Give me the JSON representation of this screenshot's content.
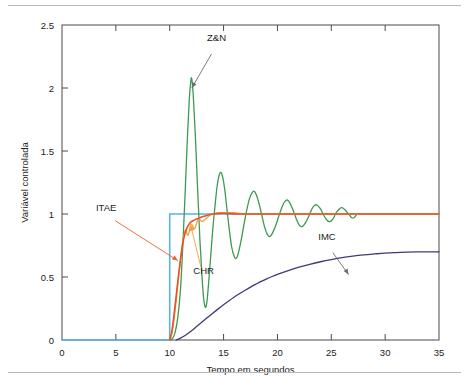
{
  "figure": {
    "background_color": "#ffffff",
    "rules": {
      "top_color": "#b9b9bd",
      "bottom_color": "#b9b9bd"
    }
  },
  "chart_data": {
    "type": "line",
    "title": "",
    "subtitle": "",
    "xlabel": "Tempo em segundos",
    "ylabel": "Variável controlada",
    "xlim": [
      0,
      35
    ],
    "ylim": [
      0,
      2.5
    ],
    "xticks": [
      0,
      5,
      10,
      15,
      20,
      25,
      30,
      35
    ],
    "xticklabels": [
      "0",
      "5",
      "10",
      "15",
      "20",
      "25",
      "30",
      "35"
    ],
    "yticks": [
      0,
      0.5,
      1,
      1.5,
      2,
      2.5
    ],
    "yticklabels": [
      "0",
      "0.5",
      "1",
      "1.5",
      "2",
      "2.5"
    ],
    "grid": false,
    "legend_position": "inline-annotations",
    "frame_color": "#4a4a4a",
    "annotations": [
      {
        "text": "Z&N",
        "label_x": 14.35,
        "label_y": 2.37,
        "point_x": 12.05,
        "point_y": 2.0,
        "color": "#6d6d6d"
      },
      {
        "text": "ITAE",
        "label_x": 4.1,
        "label_y": 1.02,
        "point_x": 10.75,
        "point_y": 0.63,
        "color": "#e8632a"
      },
      {
        "text": "CHR",
        "label_x": 13.15,
        "label_y": 0.52,
        "point_x": 11.95,
        "point_y": 0.91,
        "color": "#f2a03c"
      },
      {
        "text": "IMC",
        "label_x": 24.6,
        "label_y": 0.79,
        "point_x": 26.6,
        "point_y": 0.52,
        "color": "#6d6d6d"
      }
    ],
    "series": [
      {
        "name": "Setpoint (degrau)",
        "color": "#58b4e2",
        "width": 1.6,
        "points": [
          [
            0,
            0
          ],
          [
            10,
            0
          ],
          [
            10,
            1
          ],
          [
            35,
            1
          ]
        ]
      },
      {
        "name": "Z&N",
        "color": "#3d9a54",
        "width": 1.3,
        "points": [
          [
            10.0,
            0.0
          ],
          [
            10.25,
            0.01
          ],
          [
            10.5,
            0.06
          ],
          [
            10.75,
            0.18
          ],
          [
            11.0,
            0.4
          ],
          [
            11.2,
            0.72
          ],
          [
            11.4,
            1.1
          ],
          [
            11.6,
            1.52
          ],
          [
            11.8,
            1.88
          ],
          [
            11.95,
            2.05
          ],
          [
            12.05,
            2.07
          ],
          [
            12.2,
            1.92
          ],
          [
            12.4,
            1.58
          ],
          [
            12.6,
            1.18
          ],
          [
            12.8,
            0.8
          ],
          [
            13.0,
            0.5
          ],
          [
            13.15,
            0.33
          ],
          [
            13.3,
            0.26
          ],
          [
            13.45,
            0.3
          ],
          [
            13.6,
            0.44
          ],
          [
            13.8,
            0.66
          ],
          [
            14.0,
            0.88
          ],
          [
            14.2,
            1.06
          ],
          [
            14.4,
            1.22
          ],
          [
            14.6,
            1.31
          ],
          [
            14.75,
            1.33
          ],
          [
            14.9,
            1.3
          ],
          [
            15.1,
            1.2
          ],
          [
            15.3,
            1.05
          ],
          [
            15.5,
            0.9
          ],
          [
            15.75,
            0.74
          ],
          [
            16.0,
            0.66
          ],
          [
            16.2,
            0.65
          ],
          [
            16.4,
            0.7
          ],
          [
            16.65,
            0.8
          ],
          [
            16.9,
            0.92
          ],
          [
            17.15,
            1.03
          ],
          [
            17.4,
            1.12
          ],
          [
            17.65,
            1.17
          ],
          [
            17.85,
            1.18
          ],
          [
            18.05,
            1.15
          ],
          [
            18.3,
            1.08
          ],
          [
            18.55,
            0.99
          ],
          [
            18.8,
            0.9
          ],
          [
            19.05,
            0.84
          ],
          [
            19.3,
            0.82
          ],
          [
            19.55,
            0.85
          ],
          [
            19.85,
            0.91
          ],
          [
            20.15,
            0.99
          ],
          [
            20.45,
            1.06
          ],
          [
            20.7,
            1.1
          ],
          [
            20.95,
            1.11
          ],
          [
            21.2,
            1.08
          ],
          [
            21.5,
            1.02
          ],
          [
            21.8,
            0.95
          ],
          [
            22.05,
            0.91
          ],
          [
            22.3,
            0.9
          ],
          [
            22.6,
            0.93
          ],
          [
            22.9,
            0.98
          ],
          [
            23.2,
            1.04
          ],
          [
            23.45,
            1.07
          ],
          [
            23.7,
            1.07
          ],
          [
            24.0,
            1.04
          ],
          [
            24.3,
            0.99
          ],
          [
            24.6,
            0.95
          ],
          [
            24.85,
            0.94
          ],
          [
            25.15,
            0.96
          ],
          [
            25.45,
            1.01
          ],
          [
            25.75,
            1.04
          ],
          [
            26.0,
            1.05
          ],
          [
            26.3,
            1.03
          ],
          [
            26.6,
            1.0
          ],
          [
            26.9,
            0.97
          ],
          [
            27.1,
            0.97
          ],
          [
            27.3,
            0.99
          ]
        ]
      },
      {
        "name": "CHR",
        "color": "#f2a03c",
        "width": 1.3,
        "points": [
          [
            10.0,
            0.0
          ],
          [
            10.2,
            0.05
          ],
          [
            10.4,
            0.16
          ],
          [
            10.6,
            0.31
          ],
          [
            10.8,
            0.48
          ],
          [
            11.0,
            0.63
          ],
          [
            11.15,
            0.74
          ],
          [
            11.3,
            0.82
          ],
          [
            11.45,
            0.87
          ],
          [
            11.55,
            0.86
          ],
          [
            11.65,
            0.83
          ],
          [
            11.78,
            0.85
          ],
          [
            11.9,
            0.9
          ],
          [
            12.02,
            0.92
          ],
          [
            12.15,
            0.9
          ],
          [
            12.28,
            0.88
          ],
          [
            12.4,
            0.9
          ],
          [
            12.55,
            0.94
          ],
          [
            12.7,
            0.96
          ],
          [
            12.85,
            0.95
          ],
          [
            13.0,
            0.94
          ],
          [
            13.2,
            0.95
          ],
          [
            13.45,
            0.97
          ],
          [
            13.75,
            0.99
          ],
          [
            14.1,
            1.0
          ],
          [
            14.6,
            1.01
          ],
          [
            15.2,
            1.01
          ],
          [
            16.0,
            1.01
          ],
          [
            17.0,
            1.0
          ],
          [
            19.0,
            1.0
          ],
          [
            24.0,
            1.0
          ],
          [
            30.0,
            1.0
          ],
          [
            35.0,
            1.0
          ]
        ]
      },
      {
        "name": "ITAE",
        "color": "#e8512a",
        "width": 1.6,
        "points": [
          [
            10.0,
            0.0
          ],
          [
            10.2,
            0.07
          ],
          [
            10.4,
            0.2
          ],
          [
            10.6,
            0.35
          ],
          [
            10.8,
            0.5
          ],
          [
            11.0,
            0.64
          ],
          [
            11.2,
            0.76
          ],
          [
            11.4,
            0.84
          ],
          [
            11.6,
            0.89
          ],
          [
            11.8,
            0.92
          ],
          [
            12.0,
            0.94
          ],
          [
            12.25,
            0.95
          ],
          [
            12.5,
            0.96
          ],
          [
            12.8,
            0.97
          ],
          [
            13.1,
            0.98
          ],
          [
            13.5,
            0.99
          ],
          [
            14.0,
            1.0
          ],
          [
            14.6,
            1.005
          ],
          [
            15.3,
            1.005
          ],
          [
            16.2,
            1.0
          ],
          [
            17.5,
            1.0
          ],
          [
            20.0,
            1.0
          ],
          [
            25.0,
            1.0
          ],
          [
            30.0,
            1.0
          ],
          [
            35.0,
            1.0
          ]
        ]
      },
      {
        "name": "IMC",
        "color": "#3f3a76",
        "width": 1.3,
        "points": [
          [
            10.6,
            0.0
          ],
          [
            11.0,
            0.015
          ],
          [
            11.5,
            0.04
          ],
          [
            12.0,
            0.072
          ],
          [
            12.5,
            0.107
          ],
          [
            13.0,
            0.142
          ],
          [
            13.5,
            0.178
          ],
          [
            14.0,
            0.213
          ],
          [
            14.5,
            0.247
          ],
          [
            15.0,
            0.28
          ],
          [
            15.5,
            0.311
          ],
          [
            16.0,
            0.341
          ],
          [
            16.5,
            0.369
          ],
          [
            17.0,
            0.395
          ],
          [
            17.5,
            0.42
          ],
          [
            18.0,
            0.443
          ],
          [
            18.5,
            0.465
          ],
          [
            19.0,
            0.485
          ],
          [
            19.5,
            0.504
          ],
          [
            20.0,
            0.521
          ],
          [
            21.0,
            0.551
          ],
          [
            22.0,
            0.578
          ],
          [
            23.0,
            0.601
          ],
          [
            24.0,
            0.621
          ],
          [
            25.0,
            0.638
          ],
          [
            26.0,
            0.653
          ],
          [
            27.0,
            0.665
          ],
          [
            28.0,
            0.675
          ],
          [
            29.0,
            0.683
          ],
          [
            30.0,
            0.69
          ],
          [
            31.0,
            0.694
          ],
          [
            32.0,
            0.697
          ],
          [
            33.0,
            0.699
          ],
          [
            34.0,
            0.7
          ],
          [
            35.0,
            0.7
          ]
        ]
      }
    ]
  }
}
